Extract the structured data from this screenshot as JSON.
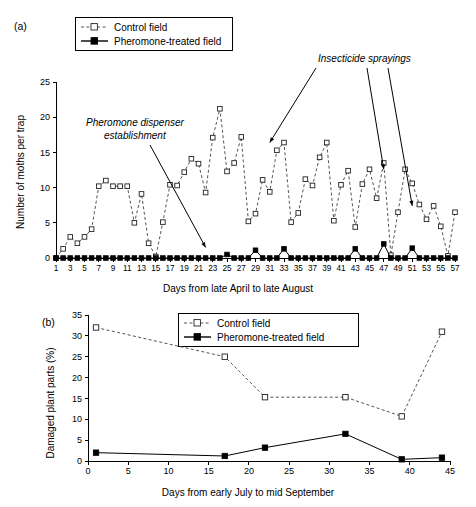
{
  "figure": {
    "panel_a_label": "(a)",
    "panel_b_label": "(b)"
  },
  "legend": {
    "control_label": "Control field",
    "treated_label": "Pheromone-treated field"
  },
  "annotations": {
    "pheromone": "Pheromone dispenser\nestablishment",
    "pheromone_line1": "Pheromone dispenser",
    "pheromone_line2": "establishment",
    "insecticide": "Insecticide sprayings"
  },
  "colors": {
    "control_line": "#555555",
    "treated_line": "#000000",
    "marker_open_fill": "#ffffff",
    "axis": "#000000"
  },
  "chart_data": [
    {
      "type": "line",
      "panel": "(a)",
      "title": "",
      "xlabel": "Days from late April to late August",
      "ylabel": "Number of moths per trap",
      "xlim": [
        1,
        57
      ],
      "ylim": [
        0,
        25
      ],
      "yticks": [
        0,
        5,
        10,
        15,
        20,
        25
      ],
      "xticks": [
        1,
        3,
        5,
        7,
        9,
        11,
        13,
        15,
        17,
        19,
        21,
        23,
        25,
        27,
        29,
        31,
        33,
        35,
        37,
        39,
        41,
        43,
        45,
        47,
        49,
        51,
        53,
        55,
        57
      ],
      "grid": false,
      "legend_position": "top-left",
      "annotations": [
        {
          "text": "Pheromone dispenser establishment",
          "points_to_x": 22,
          "points_to_y": 1.5
        },
        {
          "text": "Insecticide sprayings",
          "points_to_x": 31,
          "points_to_y": 16.4
        },
        {
          "text": "Insecticide sprayings",
          "points_to_x": 47,
          "points_to_y": 12.6
        },
        {
          "text": "Insecticide sprayings",
          "points_to_x": 51,
          "points_to_y": 7.4
        }
      ],
      "x": [
        1,
        2,
        3,
        4,
        5,
        6,
        7,
        8,
        9,
        10,
        11,
        12,
        13,
        14,
        15,
        16,
        17,
        18,
        19,
        20,
        21,
        22,
        23,
        24,
        25,
        26,
        27,
        28,
        29,
        30,
        31,
        32,
        33,
        34,
        35,
        36,
        37,
        38,
        39,
        40,
        41,
        42,
        43,
        44,
        45,
        46,
        47,
        48,
        49,
        50,
        51,
        52,
        53,
        54,
        55,
        56,
        57
      ],
      "series": [
        {
          "name": "Control field",
          "marker": "open-square",
          "linestyle": "dashed",
          "values": [
            0,
            1.3,
            3,
            2.1,
            3,
            4.1,
            10.2,
            11,
            10.2,
            10.2,
            10.2,
            5,
            9.1,
            2.1,
            0.2,
            5.1,
            10.4,
            10.3,
            12.2,
            14.1,
            13.4,
            9.3,
            17.1,
            21.2,
            12.3,
            13.5,
            17.2,
            5.2,
            6.3,
            11.1,
            9.4,
            15.3,
            16.4,
            5.1,
            6.4,
            11.2,
            10.3,
            14.3,
            16.4,
            5.3,
            10.4,
            12.4,
            4.4,
            10.5,
            12.6,
            8.5,
            13.5,
            0.4,
            6.5,
            12.6,
            10.6,
            7.6,
            5.5,
            7.4,
            4.5,
            0.3,
            6.5
          ]
        },
        {
          "name": "Pheromone-treated field",
          "marker": "filled-square",
          "linestyle": "solid",
          "values": [
            0,
            0,
            0,
            0,
            0,
            0,
            0,
            0,
            0,
            0,
            0,
            0,
            0,
            0,
            0,
            0,
            0,
            0,
            0,
            0,
            0,
            0,
            0,
            0,
            0.5,
            0,
            0,
            0,
            1.1,
            0,
            0,
            0,
            1.3,
            0,
            0,
            0,
            0,
            0,
            0,
            0,
            0,
            0,
            1.3,
            0,
            0,
            0,
            2.0,
            0,
            0,
            0,
            1.4,
            0,
            0,
            0,
            0,
            0,
            0
          ]
        }
      ]
    },
    {
      "type": "line",
      "panel": "(b)",
      "title": "",
      "xlabel": "Days from early July to mid September",
      "ylabel": "Damaged plant parts (%)",
      "xlim": [
        0,
        45
      ],
      "ylim": [
        0,
        35
      ],
      "yticks": [
        0,
        5,
        10,
        15,
        20,
        25,
        30,
        35
      ],
      "xticks": [
        0,
        5,
        10,
        15,
        20,
        25,
        30,
        35,
        40,
        45
      ],
      "grid": false,
      "legend_position": "top-center",
      "x": [
        1,
        17,
        22,
        32,
        39,
        44
      ],
      "series": [
        {
          "name": "Control field",
          "marker": "open-square",
          "linestyle": "dashed",
          "values": [
            32.0,
            25.0,
            15.3,
            15.3,
            10.7,
            31.0
          ]
        },
        {
          "name": "Pheromone-treated field",
          "marker": "filled-square",
          "linestyle": "solid",
          "values": [
            2.0,
            1.2,
            3.2,
            6.5,
            0.4,
            0.8
          ]
        }
      ]
    }
  ]
}
